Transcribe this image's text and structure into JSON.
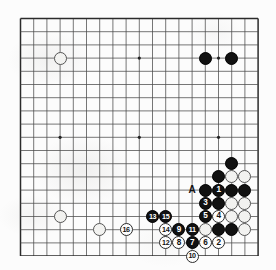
{
  "diagram": {
    "type": "go-board-diagram",
    "board_size": 19,
    "visible_region": {
      "columns": 19,
      "rows": 18,
      "note": "bottom edge of board shown at image bottom"
    },
    "label_A": "A",
    "colors": {
      "black_stone": "#111111",
      "white_stone": "#fdfdfd",
      "grid_line": "#4a4a4a",
      "border_line": "#2b2b2b",
      "paper": "#fcfcfc"
    },
    "star_points": [
      {
        "col": 3,
        "row": 3
      },
      {
        "col": 9,
        "row": 3
      },
      {
        "col": 15,
        "row": 3
      },
      {
        "col": 3,
        "row": 9
      },
      {
        "col": 9,
        "row": 9
      },
      {
        "col": 15,
        "row": 9
      }
    ],
    "plain_stones": [
      {
        "col": 3,
        "row": 3,
        "color": "white"
      },
      {
        "col": 14,
        "row": 3,
        "color": "black"
      },
      {
        "col": 16,
        "row": 3,
        "color": "black"
      },
      {
        "col": 16,
        "row": 11,
        "color": "black"
      },
      {
        "col": 15,
        "row": 12,
        "color": "black"
      },
      {
        "col": 16,
        "row": 12,
        "color": "white"
      },
      {
        "col": 17,
        "row": 12,
        "color": "white"
      },
      {
        "col": 14,
        "row": 13,
        "color": "black"
      },
      {
        "col": 16,
        "row": 13,
        "color": "black"
      },
      {
        "col": 17,
        "row": 13,
        "color": "black"
      },
      {
        "col": 15,
        "row": 14,
        "color": "black"
      },
      {
        "col": 16,
        "row": 14,
        "color": "white"
      },
      {
        "col": 17,
        "row": 14,
        "color": "white"
      },
      {
        "col": 16,
        "row": 15,
        "color": "white"
      },
      {
        "col": 17,
        "row": 15,
        "color": "white"
      },
      {
        "col": 15,
        "row": 16,
        "color": "black"
      },
      {
        "col": 16,
        "row": 16,
        "color": "black"
      },
      {
        "col": 17,
        "row": 16,
        "color": "white"
      },
      {
        "col": 14,
        "row": 16,
        "color": "white"
      },
      {
        "col": 3,
        "row": 15,
        "color": "white"
      },
      {
        "col": 6,
        "row": 16,
        "color": "white"
      }
    ],
    "numbered_moves": [
      {
        "n": 1,
        "col": 15,
        "row": 13,
        "color": "black"
      },
      {
        "n": 2,
        "col": 15,
        "row": 17,
        "color": "white"
      },
      {
        "n": 3,
        "col": 14,
        "row": 14,
        "color": "black"
      },
      {
        "n": 4,
        "col": 15,
        "row": 15,
        "color": "white"
      },
      {
        "n": 5,
        "col": 14,
        "row": 15,
        "color": "black"
      },
      {
        "n": 6,
        "col": 14,
        "row": 17,
        "color": "white"
      },
      {
        "n": 7,
        "col": 13,
        "row": 17,
        "color": "black"
      },
      {
        "n": 8,
        "col": 12,
        "row": 17,
        "color": "white"
      },
      {
        "n": 9,
        "col": 12,
        "row": 16,
        "color": "black"
      },
      {
        "n": 10,
        "col": 13,
        "row": 18,
        "color": "white"
      },
      {
        "n": 11,
        "col": 13,
        "row": 16,
        "color": "black"
      },
      {
        "n": 12,
        "col": 11,
        "row": 17,
        "color": "white"
      },
      {
        "n": 13,
        "col": 10,
        "row": 15,
        "color": "black"
      },
      {
        "n": 14,
        "col": 11,
        "row": 16,
        "color": "white"
      },
      {
        "n": 15,
        "col": 11,
        "row": 15,
        "color": "black"
      },
      {
        "n": 16,
        "col": 8,
        "row": 16,
        "color": "white"
      }
    ],
    "markers": [
      {
        "text": "A",
        "col": 13,
        "row": 13
      }
    ]
  }
}
